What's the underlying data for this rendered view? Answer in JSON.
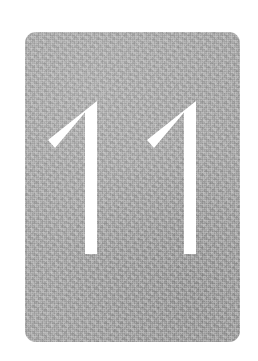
{
  "scene": {
    "width": 258,
    "height": 361,
    "background_color": "#ffffff",
    "description": "Large white numeral on a grainy grey rounded card"
  },
  "card": {
    "name": "number-card",
    "x": 25,
    "y": 32,
    "width": 215,
    "height": 310,
    "corner_radius": 11,
    "fill_color": "#a8a8a8",
    "texture": "film-grain",
    "grain_light_color": "#ffffff",
    "grain_dark_color": "#000000"
  },
  "numeral": {
    "name": "numeral-eleven",
    "value": "11",
    "digit_count": 2,
    "color": "#ffffff",
    "style": "geometric-sans, flag-and-stem, flat terminals, no base serif",
    "top_y": 101,
    "bottom_y": 254,
    "cap_height": 153,
    "stroke_width": 12,
    "digits": [
      {
        "name": "digit-one-first",
        "glyph": "1",
        "apex_x": 97,
        "apex_y": 101,
        "stem_left": 85,
        "stem_right": 97,
        "flag_tip_x": 48,
        "flag_tip_y": 148,
        "baseline_y": 254
      },
      {
        "name": "digit-one-second",
        "glyph": "1",
        "apex_x": 196,
        "apex_y": 101,
        "stem_left": 184,
        "stem_right": 196,
        "flag_tip_x": 147,
        "flag_tip_y": 148,
        "baseline_y": 254
      }
    ]
  }
}
